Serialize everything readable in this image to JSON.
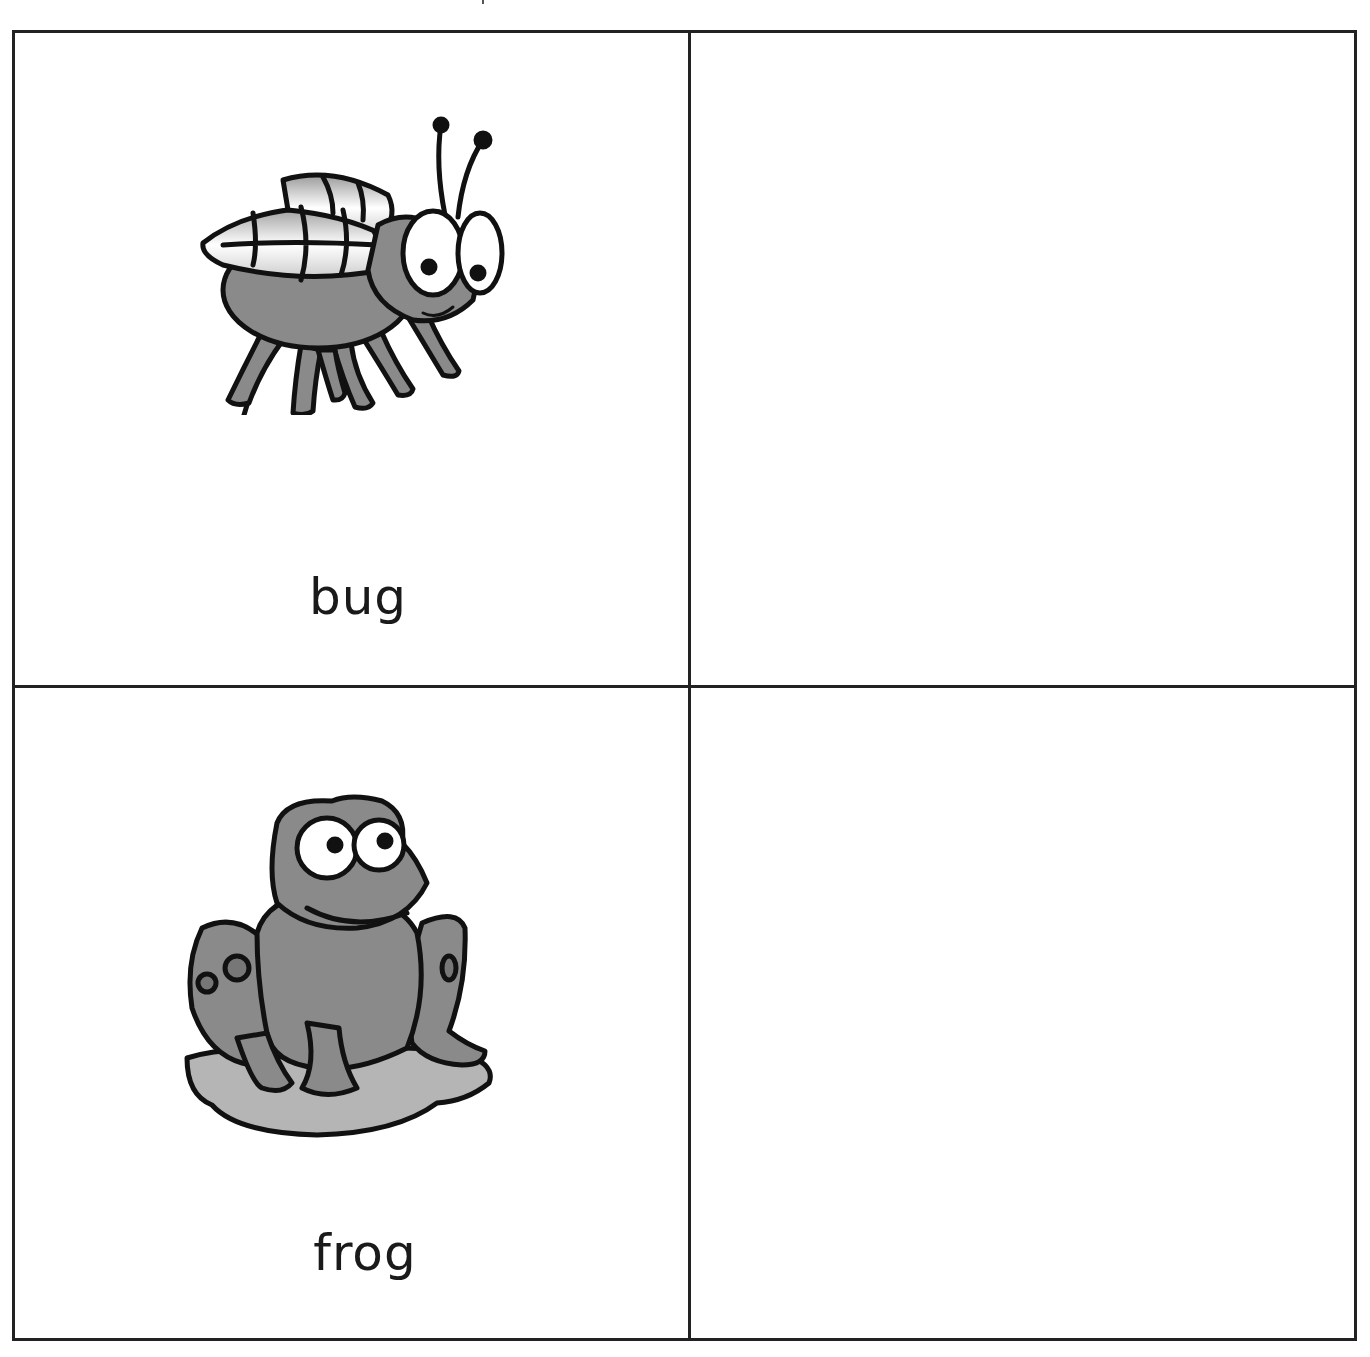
{
  "worksheet": {
    "cells": [
      {
        "word": "bug",
        "picture": "bug-illustration"
      },
      {
        "word": "",
        "picture": ""
      },
      {
        "word": "frog",
        "picture": "frog-illustration"
      },
      {
        "word": "",
        "picture": ""
      }
    ]
  },
  "colors": {
    "border": "#222222",
    "fill_gray": "#8a8a8a",
    "light_gray": "#b5b5b5",
    "background": "#ffffff"
  }
}
